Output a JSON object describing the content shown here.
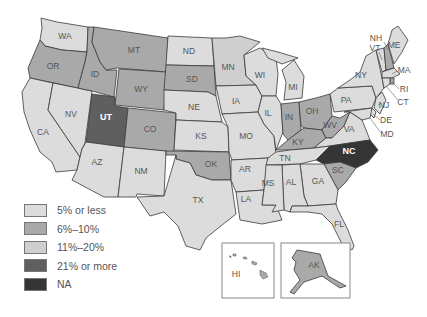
{
  "colors": {
    "c5": "#dcdcdc",
    "c6_10": "#a9a9a9",
    "c11_20": "#cfcfcf",
    "c21": "#5f5f5f",
    "na": "#353535"
  },
  "legend": [
    {
      "label": "5% or less",
      "color": "#dcdcdc"
    },
    {
      "label": "6%–10%",
      "color": "#a9a9a9"
    },
    {
      "label": "11%–20%",
      "color": "#cfcfcf"
    },
    {
      "label": "21% or more",
      "color": "#5f5f5f"
    },
    {
      "label": "NA",
      "color": "#353535"
    }
  ],
  "states": {
    "WA": "WA",
    "OR": "OR",
    "CA": "CA",
    "NV": "NV",
    "ID": "ID",
    "MT": "MT",
    "WY": "WY",
    "UT": "UT",
    "CO": "CO",
    "AZ": "AZ",
    "NM": "NM",
    "ND": "ND",
    "SD": "SD",
    "NE": "NE",
    "KS": "KS",
    "OK": "OK",
    "TX": "TX",
    "MN": "MN",
    "IA": "IA",
    "MO": "MO",
    "AR": "AR",
    "LA": "LA",
    "WI": "WI",
    "IL": "IL",
    "MI": "MI",
    "IN": "IN",
    "OH": "OH",
    "KY": "KY",
    "TN": "TN",
    "MS": "MS",
    "AL": "AL",
    "GA": "GA",
    "FL": "FL",
    "SC": "SC",
    "NC": "NC",
    "VA": "VA",
    "WV": "WV",
    "PA": "PA",
    "NY": "NY",
    "VT": "VT",
    "NH": "NH",
    "ME": "ME",
    "MA": "MA",
    "RI": "RI",
    "CT": "CT",
    "NJ": "NJ",
    "DE": "DE",
    "MD": "MD",
    "HI": "HI",
    "AK": "AK"
  },
  "categories": {
    "5% or less": [
      "WA",
      "CA",
      "NV",
      "AZ",
      "NM",
      "ND",
      "NE",
      "KS",
      "TX",
      "IA",
      "MO",
      "AR",
      "LA",
      "IL",
      "TN",
      "MS",
      "AL",
      "GA",
      "FL",
      "PA",
      "NY",
      "VT",
      "MA",
      "CT",
      "NJ",
      "DE",
      "MD",
      "WI",
      "MI",
      "VA",
      "ME"
    ],
    "6%–10%": [
      "OR",
      "ID",
      "MT",
      "WY",
      "CO",
      "SD",
      "OK",
      "IN",
      "OH",
      "KY",
      "WV",
      "SC",
      "NH",
      "RI",
      "AK"
    ],
    "11%–20%": [
      "MN"
    ],
    "21% or more": [
      "UT"
    ],
    "NA": [
      "NC"
    ]
  }
}
